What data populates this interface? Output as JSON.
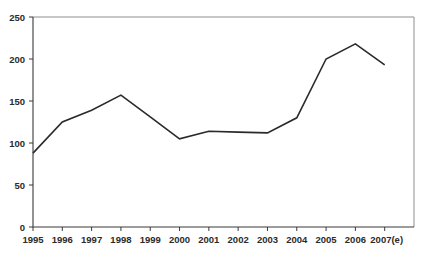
{
  "chart_data": {
    "type": "line",
    "title": "",
    "subtitle": "",
    "xlabel": "",
    "ylabel": "",
    "categories": [
      "1995",
      "1996",
      "1997",
      "1998",
      "1999",
      "2000",
      "2001",
      "2002",
      "2003",
      "2004",
      "2005",
      "2006",
      "2007(e)"
    ],
    "values": [
      88,
      125,
      139,
      157,
      131,
      105,
      114,
      113,
      112,
      130,
      200,
      218,
      193
    ],
    "series": [
      {
        "name": "",
        "values": [
          88,
          125,
          139,
          157,
          131,
          105,
          114,
          113,
          112,
          130,
          200,
          218,
          193
        ]
      }
    ],
    "ylim": [
      0,
      250
    ],
    "yticks": [
      0,
      50,
      100,
      150,
      200,
      250
    ],
    "ytick_labels": [
      "0",
      "50",
      "100",
      "150",
      "200",
      "250"
    ],
    "xtick_labels": [
      "1995",
      "1996",
      "1997",
      "1998",
      "1999",
      "2000",
      "2001",
      "2002",
      "2003",
      "2004",
      "2005",
      "2006",
      "2007(e)"
    ],
    "grid": false,
    "legend": null,
    "legend_position": "none",
    "annotations": [],
    "line_color": "#2a2a2a",
    "frame_color": "#8e8e8e",
    "axis_color": "#3a3a3a",
    "background_color": "#ffffff"
  },
  "axes": {
    "y_ticks": [
      {
        "label": "250",
        "value": 250
      },
      {
        "label": "200",
        "value": 200
      },
      {
        "label": "150",
        "value": 150
      },
      {
        "label": "100",
        "value": 100
      },
      {
        "label": "50",
        "value": 50
      },
      {
        "label": "0",
        "value": 0
      }
    ],
    "x_ticks": [
      {
        "label": "1995"
      },
      {
        "label": "1996"
      },
      {
        "label": "1997"
      },
      {
        "label": "1998"
      },
      {
        "label": "1999"
      },
      {
        "label": "2000"
      },
      {
        "label": "2001"
      },
      {
        "label": "2002"
      },
      {
        "label": "2003"
      },
      {
        "label": "2004"
      },
      {
        "label": "2005"
      },
      {
        "label": "2006"
      },
      {
        "label": "2007(e)"
      }
    ]
  }
}
